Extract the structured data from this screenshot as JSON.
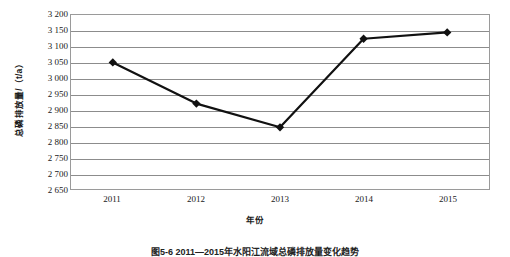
{
  "chart_data": {
    "type": "line",
    "title": "",
    "categories": [
      "2011",
      "2012",
      "2013",
      "2014",
      "2015"
    ],
    "values": [
      3050,
      2920,
      2845,
      3125,
      3145
    ],
    "series": [
      {
        "name": "总磷排放量",
        "values": [
          3050,
          2920,
          2845,
          3125,
          3145
        ]
      }
    ],
    "xlabel": "年份",
    "ylabel": "总磷排放量/（t/a）",
    "ylim": [
      2650,
      3200
    ],
    "ytick_step": 50,
    "yticks": [
      3200,
      3150,
      3100,
      3050,
      3000,
      2950,
      2900,
      2850,
      2800,
      2750,
      2700,
      2650
    ],
    "ytick_labels": [
      "3 200",
      "3 150",
      "3 100",
      "3 050",
      "3 000",
      "2 950",
      "2 900",
      "2 850",
      "2 800",
      "2 750",
      "2 700",
      "2 650"
    ],
    "xtick_labels": [
      "2011",
      "2012",
      "2013",
      "2014",
      "2015"
    ],
    "grid": "horizontal",
    "legend": "none",
    "marker": "diamond",
    "line_color": "#111111",
    "grid_color": "#8c8c8c",
    "border_color": "#9a9a9a"
  },
  "figure": {
    "caption": "图5-6  2011—2015年水阳江流域总磷排放量变化趋势"
  }
}
